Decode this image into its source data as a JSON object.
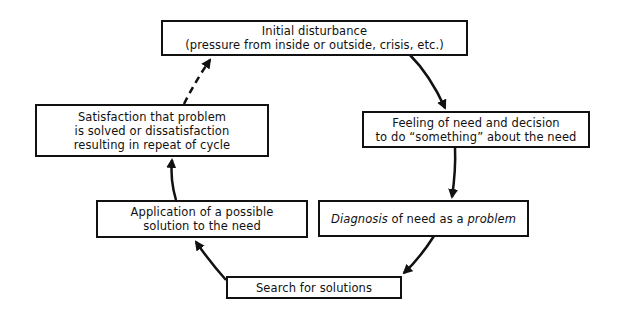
{
  "diagram": {
    "type": "cycle-flowchart",
    "nodes": [
      {
        "id": "initial",
        "lines": [
          "Initial disturbance",
          "(pressure from inside or outside, crisis, etc.)"
        ]
      },
      {
        "id": "feeling",
        "lines": [
          "Feeling of need and decision",
          "to do “something” about the need"
        ]
      },
      {
        "id": "diagnosis",
        "parts": {
          "italic1": "Diagnosis",
          "mid": " of need as a ",
          "italic2": "problem"
        }
      },
      {
        "id": "search",
        "lines": [
          "Search for solutions"
        ]
      },
      {
        "id": "application",
        "lines": [
          "Application of a possible",
          "solution to the need"
        ]
      },
      {
        "id": "satisfaction",
        "lines": [
          "Satisfaction that problem",
          "is solved or dissatisfaction",
          "resulting in repeat of cycle"
        ]
      }
    ],
    "edges": [
      {
        "from": "initial",
        "to": "feeling",
        "style": "solid"
      },
      {
        "from": "feeling",
        "to": "diagnosis",
        "style": "solid"
      },
      {
        "from": "diagnosis",
        "to": "search",
        "style": "solid"
      },
      {
        "from": "search",
        "to": "application",
        "style": "solid"
      },
      {
        "from": "application",
        "to": "satisfaction",
        "style": "solid"
      },
      {
        "from": "satisfaction",
        "to": "initial",
        "style": "dashed"
      }
    ]
  }
}
